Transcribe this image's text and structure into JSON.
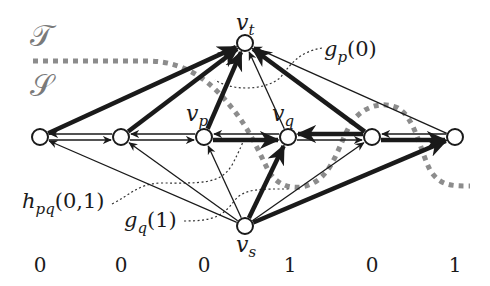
{
  "diagram": {
    "regions": {
      "top_label": "𝒯",
      "bottom_label": "𝒮"
    },
    "nodes": [
      {
        "id": "n1",
        "label": "",
        "value": "0"
      },
      {
        "id": "n2",
        "label": "",
        "value": "0"
      },
      {
        "id": "vp",
        "label": "p",
        "value": "0"
      },
      {
        "id": "vq",
        "label": "q",
        "value": "1"
      },
      {
        "id": "n5",
        "label": "",
        "value": "0"
      },
      {
        "id": "n6",
        "label": "",
        "value": "1"
      }
    ],
    "terminals": {
      "source": {
        "id": "vs",
        "base": "v",
        "sub": "s"
      },
      "sink": {
        "id": "vt",
        "base": "v",
        "sub": "t"
      }
    },
    "edges_to_sink": [
      {
        "from": "n1",
        "weight": "thick"
      },
      {
        "from": "n2",
        "weight": "thick"
      },
      {
        "from": "vp",
        "weight": "thick"
      },
      {
        "from": "vq",
        "weight": "thin"
      },
      {
        "from": "n5",
        "weight": "thick"
      },
      {
        "from": "n6",
        "weight": "thin"
      }
    ],
    "edges_from_source": [
      {
        "to": "n1",
        "weight": "thin"
      },
      {
        "to": "n2",
        "weight": "thin"
      },
      {
        "to": "vp",
        "weight": "thin"
      },
      {
        "to": "vq",
        "weight": "thick"
      },
      {
        "to": "n5",
        "weight": "thin"
      },
      {
        "to": "n6",
        "weight": "thick"
      }
    ],
    "horizontal_edges": [
      {
        "pair": [
          "n1",
          "n2"
        ],
        "forward": "thin",
        "backward": "thin"
      },
      {
        "pair": [
          "n2",
          "vp"
        ],
        "forward": "thin",
        "backward": "thin"
      },
      {
        "pair": [
          "vp",
          "vq"
        ],
        "forward": "thick",
        "backward": "thin"
      },
      {
        "pair": [
          "vq",
          "n5"
        ],
        "forward": "thin",
        "backward": "thick"
      },
      {
        "pair": [
          "n5",
          "n6"
        ],
        "forward": "thick",
        "backward": "thin"
      }
    ],
    "annotations": [
      {
        "id": "gp0",
        "base": "g",
        "sub": "p",
        "args": "(0)"
      },
      {
        "id": "hpq01",
        "base": "h",
        "sub": "pq",
        "args": "(0,1)"
      },
      {
        "id": "gq1",
        "base": "g",
        "sub": "q",
        "args": "(1)"
      }
    ],
    "colors": {
      "edge": "#1a1a1a",
      "cut": "#8c8c8c",
      "leader": "#333333",
      "region_label": "#7a7a7a"
    }
  }
}
